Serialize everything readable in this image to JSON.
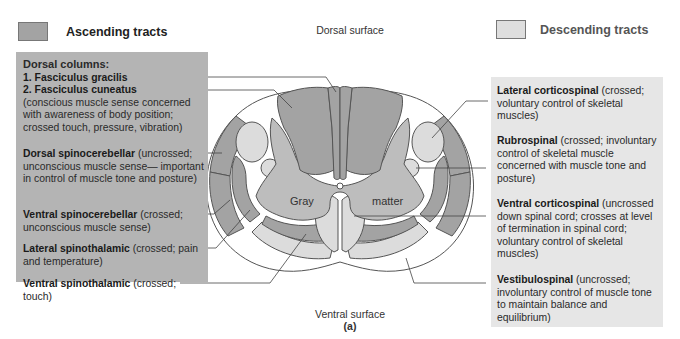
{
  "legend": {
    "ascending": {
      "label": "Ascending tracts",
      "color": "#a3a3a3"
    },
    "descending": {
      "label": "Descending tracts",
      "color": "#dedede"
    }
  },
  "orientation": {
    "dorsal": "Dorsal surface",
    "ventral": "Ventral surface",
    "panel_label": "(a)"
  },
  "cord_labels": {
    "gray": "Gray",
    "matter": "matter"
  },
  "ascending_tracts": {
    "heading": "Dorsal columns:",
    "items": [
      {
        "name": "1. Fasciculus gracilis",
        "desc": ""
      },
      {
        "name": "2. Fasciculus cuneatus",
        "desc": "(conscious muscle sense concerned with awareness of body position; crossed touch, pressure, vibration)"
      },
      {
        "name": "Dorsal spinocerebellar",
        "desc": " (uncrossed; unconscious muscle sense— important in control of muscle tone and posture)"
      },
      {
        "name": "Ventral spinocerebellar",
        "desc": " (crossed; unconscious muscle sense)"
      },
      {
        "name": "Lateral spinothalamic",
        "desc": " (crossed; pain and temperature)"
      },
      {
        "name": "Ventral spinothalamic",
        "desc": " (crossed; touch)"
      }
    ]
  },
  "descending_tracts": {
    "items": [
      {
        "name": "Lateral corticospinal",
        "desc": " (crossed; voluntary control of skeletal muscles)"
      },
      {
        "name": "Rubrospinal",
        "desc": " (crossed; involuntary control of skeletal muscle concerned with muscle tone and posture)"
      },
      {
        "name": "Ventral corticospinal",
        "desc": " (uncrossed down spinal cord; crosses at level of termination in spinal cord; voluntary control of skeletal muscles)"
      },
      {
        "name": "Vestibulospinal",
        "desc": " (uncrossed; involuntary control of muscle tone to maintain balance and equilibrium)"
      }
    ]
  },
  "colors": {
    "ascending_fill": "#a3a3a3",
    "descending_fill": "#dcdcdc",
    "gray_matter": "#bdbdbd",
    "white_matter_gap": "#ffffff",
    "outline": "#555555",
    "ascending_panel_bg": "#b4b4b4",
    "descending_panel_bg": "#e6e6e6"
  }
}
